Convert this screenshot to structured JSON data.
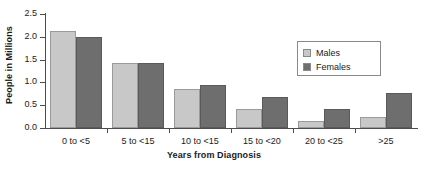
{
  "chart_data": {
    "type": "bar",
    "title": "",
    "xlabel": "Years from Diagnosis",
    "ylabel": "People in Millions",
    "categories": [
      "0 to <5",
      "5 to <15",
      "10 to <15",
      "15 to <20",
      "20 to <25",
      ">25"
    ],
    "series": [
      {
        "name": "Males",
        "color": "#c8c8c8",
        "values": [
          2.12,
          1.42,
          0.85,
          0.42,
          0.16,
          0.24
        ]
      },
      {
        "name": "Females",
        "color": "#6e6e6e",
        "values": [
          2.0,
          1.43,
          0.95,
          0.68,
          0.41,
          0.76
        ]
      }
    ],
    "ylim": [
      0.0,
      2.5
    ],
    "ytick_labels": [
      "2.5",
      "2.0",
      "1.5",
      "1.0",
      "0.5",
      "0.0"
    ],
    "ytick_values": [
      2.5,
      2.0,
      1.5,
      1.0,
      0.5,
      0.0
    ],
    "grid": false,
    "legend_position": "upper-right",
    "legend_entries": [
      "Males",
      "Females"
    ]
  },
  "axes": {
    "y_title": "People in Millions",
    "x_title": "Years from Diagnosis"
  },
  "legend": {
    "males_label": "Males",
    "females_label": "Females"
  }
}
